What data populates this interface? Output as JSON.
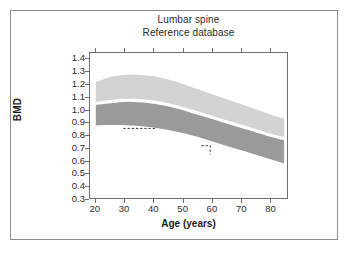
{
  "chart_data": {
    "type": "area",
    "title": "Lumbar spine",
    "subtitle": "Reference database",
    "xlabel": "Age (years)",
    "ylabel": "BMD",
    "xlim": [
      18,
      86
    ],
    "ylim": [
      0.3,
      1.45
    ],
    "grid": false,
    "legend": "none",
    "x_ticks": [
      20,
      30,
      40,
      50,
      60,
      70,
      80
    ],
    "y_ticks": [
      0.3,
      0.4,
      0.5,
      0.6,
      0.7,
      0.8,
      0.9,
      1.0,
      1.1,
      1.2,
      1.3,
      1.4
    ],
    "x": [
      20,
      25,
      30,
      35,
      40,
      45,
      50,
      55,
      60,
      65,
      70,
      75,
      80,
      85
    ],
    "series": [
      {
        "name": "upper-band-top",
        "role": "light-band-upper-bound",
        "values": [
          1.22,
          1.26,
          1.275,
          1.275,
          1.265,
          1.24,
          1.205,
          1.165,
          1.125,
          1.085,
          1.045,
          1.005,
          0.965,
          0.93
        ]
      },
      {
        "name": "mean-line",
        "role": "white-separator-mean",
        "values": [
          1.05,
          1.065,
          1.075,
          1.072,
          1.06,
          1.04,
          1.01,
          0.975,
          0.94,
          0.905,
          0.87,
          0.835,
          0.8,
          0.77
        ]
      },
      {
        "name": "lower-band-bottom",
        "role": "dark-band-lower-bound",
        "values": [
          0.875,
          0.878,
          0.877,
          0.872,
          0.86,
          0.84,
          0.815,
          0.785,
          0.75,
          0.715,
          0.68,
          0.645,
          0.61,
          0.575
        ]
      }
    ],
    "bands": [
      {
        "name": "light-band",
        "color": "#d3d3d3",
        "between": [
          "upper-band-top",
          "mean-line"
        ]
      },
      {
        "name": "dark-band",
        "color": "#9a9a9a",
        "between": [
          "mean-line",
          "lower-band-bottom"
        ]
      }
    ],
    "annotations": [
      {
        "name": "dashed-horizontal-marker",
        "style": "dashed",
        "y": 0.852,
        "x_start": 29.5,
        "x_end": 40.5
      },
      {
        "name": "dashed-corner-marker",
        "style": "dashed",
        "x": 59.5,
        "y_top": 0.715,
        "y_bottom": 0.645,
        "x_start": 56.5,
        "x_end": 59.5
      }
    ],
    "colors": {
      "light_band": "#d3d3d3",
      "dark_band": "#9a9a9a",
      "mean_line": "#ffffff",
      "axis": "#6e6e6e",
      "text": "#2b2b2b",
      "frame": "#8a8a8a",
      "background": "#ffffff"
    }
  }
}
